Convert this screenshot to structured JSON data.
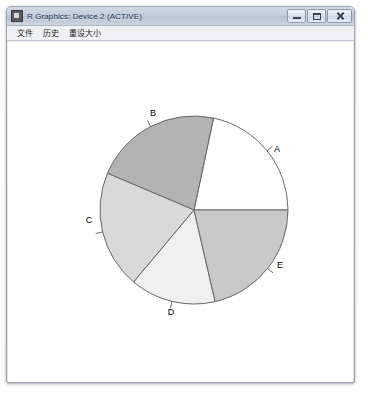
{
  "window": {
    "title": "R Graphics: Device 2 (ACTIVE)",
    "app_icon": "r-graphics-icon",
    "controls": {
      "minimize": "minimize-icon",
      "maximize": "maximize-icon",
      "close": "close-icon"
    }
  },
  "menubar": {
    "items": [
      {
        "label": "文件"
      },
      {
        "label": "历史"
      },
      {
        "label": "重设大小"
      }
    ]
  },
  "chart_data": {
    "type": "pie",
    "title": "",
    "categories": [
      "A",
      "B",
      "C",
      "D",
      "E"
    ],
    "values": [
      78,
      79,
      73,
      53,
      77
    ],
    "value_unit": "degrees",
    "start_angle_deg": 0,
    "direction": "counterclockwise",
    "slice_colors": [
      "#ffffff",
      "#b3b3b3",
      "#d9d9d9",
      "#f0f0f0",
      "#c9c9c9"
    ],
    "border_color": "#666666",
    "label_positions": [
      {
        "label": "A",
        "x": 276,
        "y": 148
      },
      {
        "label": "B",
        "x": 152,
        "y": 112
      },
      {
        "label": "C",
        "x": 88,
        "y": 219
      },
      {
        "label": "D",
        "x": 170,
        "y": 311
      },
      {
        "label": "E",
        "x": 279,
        "y": 264
      }
    ],
    "center": {
      "x": 193,
      "y": 208
    },
    "radius": 94,
    "legend": "none",
    "grid": false,
    "xlabel": "",
    "ylabel": ""
  }
}
